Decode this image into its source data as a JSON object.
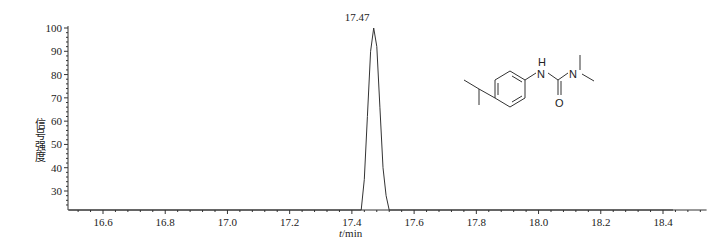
{
  "chart_data": {
    "type": "line",
    "title": "",
    "xlabel": "t/min",
    "ylabel": "信号强度",
    "xlim": [
      16.49,
      18.54
    ],
    "ylim": [
      23,
      100
    ],
    "x_ticks": [
      "16.6",
      "16.8",
      "17.0",
      "17.2",
      "17.4",
      "17.6",
      "17.8",
      "18.0",
      "18.2",
      "18.4"
    ],
    "y_ticks": [
      "30",
      "40",
      "50",
      "60",
      "70",
      "80",
      "90",
      "100"
    ],
    "grid": false,
    "legend": null,
    "series": [
      {
        "name": "chromatogram",
        "x": [
          16.49,
          17.43,
          17.44,
          17.45,
          17.46,
          17.47,
          17.48,
          17.49,
          17.5,
          17.51,
          17.52,
          18.54
        ],
        "y": [
          23,
          23,
          35,
          62,
          90,
          100,
          92,
          66,
          40,
          28,
          23,
          23
        ]
      }
    ],
    "annotations": [
      {
        "text": "17.47",
        "x": 17.47,
        "y": 100,
        "type": "peak-label"
      },
      {
        "text": "chemical-structure",
        "description": "1-(4-isopropylphenyl)-3,3-dimethylurea (isoproturon)",
        "atoms": [
          "H",
          "N",
          "N",
          "O"
        ]
      }
    ]
  },
  "labels": {
    "peak": "17.47",
    "xlabel_italic": "t",
    "xlabel_unit": "/min",
    "ylabel": "信号强度",
    "atom_H": "H",
    "atom_N1": "N",
    "atom_N2": "N",
    "atom_O": "O"
  }
}
